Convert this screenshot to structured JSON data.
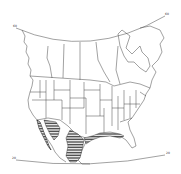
{
  "map": {
    "title": "",
    "region": "North America",
    "projection": "conic",
    "latitude_labels": {
      "top_left": "60",
      "top_right": "60",
      "bottom_left": "20",
      "bottom_right": "20"
    },
    "colors": {
      "background": "#ffffff",
      "outline": "#444444",
      "hatch": "#222222"
    },
    "hatched_region": "Mexico, southern Arizona/Texas, Gulf of Mexico coastline",
    "legend": []
  }
}
